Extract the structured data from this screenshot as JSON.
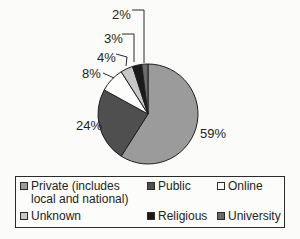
{
  "chart_data": {
    "type": "pie",
    "title": "",
    "categories": [
      "Private (includes local and national)",
      "Public",
      "Online",
      "Unknown",
      "Religious",
      "University"
    ],
    "values": [
      59,
      24,
      8,
      4,
      3,
      2
    ],
    "value_unit": "%",
    "slice_labels": [
      "59%",
      "24%",
      "8%",
      "4%",
      "3%",
      "2%"
    ],
    "colors": [
      "#9b9b9b",
      "#4f4f4f",
      "#fdfdfc",
      "#c7c7c7",
      "#1a1a1a",
      "#6b6b6b"
    ],
    "start_angle_deg": 0,
    "direction": "clockwise",
    "legend_position": "bottom",
    "legend": [
      {
        "label": "Private (includes local and national)"
      },
      {
        "label": "Public"
      },
      {
        "label": "Online"
      },
      {
        "label": "Unknown"
      },
      {
        "label": "Religious"
      },
      {
        "label": "University"
      }
    ]
  }
}
